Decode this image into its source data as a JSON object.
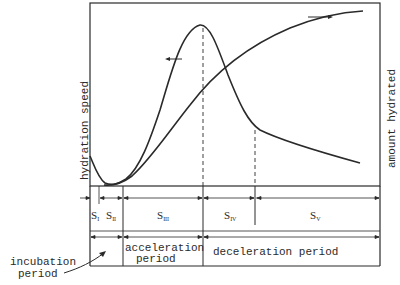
{
  "axes": {
    "left_label": "hydration speed",
    "right_label": "amount hydrated"
  },
  "stages": [
    {
      "id": "S1",
      "base": "S",
      "sub": "I"
    },
    {
      "id": "S2",
      "base": "S",
      "sub": "II"
    },
    {
      "id": "S3",
      "base": "S",
      "sub": "III"
    },
    {
      "id": "S4",
      "base": "S",
      "sub": "IV"
    },
    {
      "id": "S5",
      "base": "S",
      "sub": "V"
    }
  ],
  "periods": {
    "incubation": [
      "incubation",
      "period"
    ],
    "acceleration": [
      "acceleration",
      "period"
    ],
    "deceleration": "deceleration period"
  },
  "colors": {
    "line": "#2a2a2a",
    "background": "#ffffff"
  }
}
